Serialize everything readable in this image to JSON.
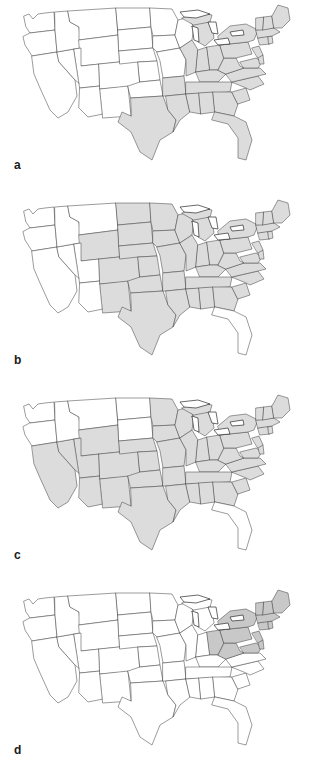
{
  "figure": {
    "type": "multi-panel-choropleth-map",
    "region": "Contiguous United States",
    "panel_count": 4,
    "colors": {
      "shaded_fill": "#dcdcdc",
      "shaded_fill_dark": "#c8c8c8",
      "unshaded_fill": "#ffffff",
      "border_stroke": "#4a4a4a",
      "coast_stroke": "#2b2b2b",
      "background": "#ffffff"
    }
  },
  "panels": [
    {
      "label": "a",
      "name": "panel-a",
      "shaded_states": [
        "TX",
        "LA",
        "MS",
        "AL",
        "GA",
        "SC",
        "NC",
        "FL",
        "TN",
        "KY",
        "VA",
        "WV",
        "OH",
        "IN",
        "IL",
        "MI",
        "PA",
        "NY",
        "MD",
        "DE",
        "NJ",
        "CT",
        "RI",
        "MA",
        "VT",
        "NH",
        "ME",
        "AR"
      ],
      "unshaded_states": [
        "WA",
        "OR",
        "CA",
        "NV",
        "ID",
        "MT",
        "WY",
        "UT",
        "AZ",
        "CO",
        "NM",
        "ND",
        "SD",
        "NE",
        "KS",
        "OK",
        "MN",
        "IA",
        "MO",
        "WI"
      ]
    },
    {
      "label": "b",
      "name": "panel-b",
      "shaded_states": [
        "NM",
        "CO",
        "WY",
        "ND",
        "SD",
        "NE",
        "KS",
        "OK",
        "TX",
        "MN",
        "IA",
        "MO",
        "AR",
        "LA",
        "WI",
        "IL",
        "IN",
        "MI",
        "OH",
        "KY",
        "TN",
        "MS",
        "AL",
        "GA",
        "SC",
        "NC",
        "VA",
        "WV",
        "PA",
        "NY",
        "MD",
        "DE",
        "NJ",
        "CT",
        "RI",
        "MA",
        "VT",
        "NH",
        "ME"
      ],
      "unshaded_states": [
        "WA",
        "OR",
        "CA",
        "NV",
        "ID",
        "MT",
        "UT",
        "AZ",
        "FL"
      ]
    },
    {
      "label": "c",
      "name": "panel-c",
      "shaded_states": [
        "CA",
        "NV",
        "UT",
        "AZ",
        "WY",
        "CO",
        "NM",
        "NE",
        "KS",
        "OK",
        "TX",
        "IA",
        "MO",
        "AR",
        "LA",
        "MN",
        "WI",
        "IL",
        "IN",
        "MI",
        "OH",
        "KY",
        "TN",
        "MS",
        "AL",
        "GA",
        "SC",
        "NC",
        "VA",
        "WV",
        "PA",
        "NY",
        "MD",
        "DE",
        "NJ",
        "CT",
        "RI",
        "MA",
        "VT",
        "NH",
        "ME"
      ],
      "unshaded_states": [
        "WA",
        "OR",
        "ID",
        "MT",
        "ND",
        "SD",
        "FL"
      ]
    },
    {
      "label": "d",
      "name": "panel-d",
      "shaded_states": [
        "OH",
        "PA",
        "NY",
        "WV",
        "MD",
        "DE",
        "NJ",
        "CT",
        "RI",
        "MA",
        "VT",
        "NH",
        "ME"
      ],
      "unshaded_states": [
        "WA",
        "OR",
        "CA",
        "NV",
        "ID",
        "MT",
        "WY",
        "UT",
        "AZ",
        "CO",
        "NM",
        "ND",
        "SD",
        "NE",
        "KS",
        "OK",
        "TX",
        "MN",
        "IA",
        "MO",
        "AR",
        "LA",
        "WI",
        "IL",
        "IN",
        "MI",
        "KY",
        "TN",
        "MS",
        "AL",
        "GA",
        "SC",
        "NC",
        "VA",
        "FL"
      ]
    }
  ]
}
